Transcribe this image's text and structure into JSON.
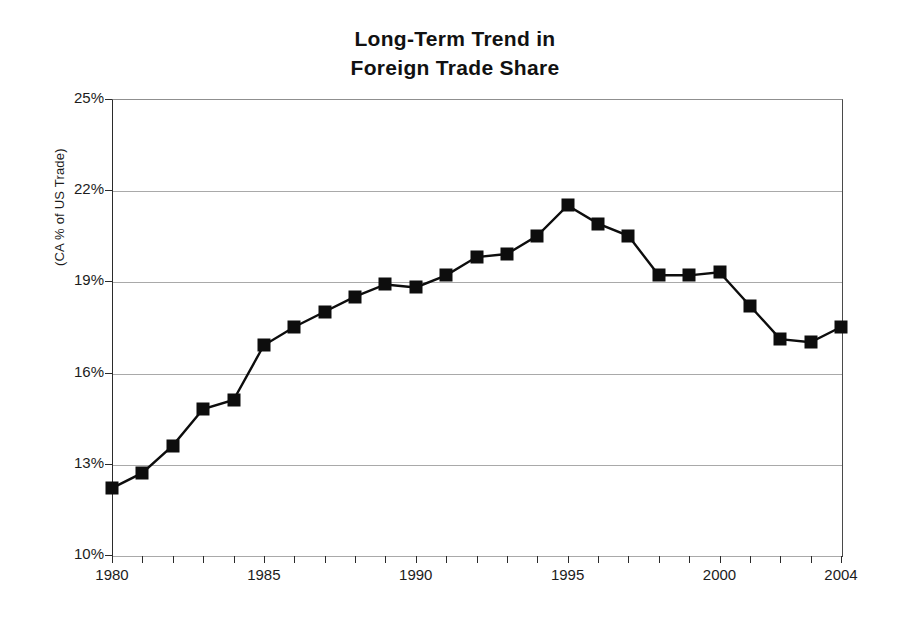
{
  "chart_data": {
    "type": "line",
    "title": "Long-Term Trend in Foreign Trade Share",
    "title_line1": "Long-Term Trend in",
    "title_line2": "Foreign Trade Share",
    "xlabel": "",
    "ylabel": "(CA % of US Trade)",
    "ylim": [
      10,
      25
    ],
    "xlim": [
      1980,
      2004
    ],
    "grid": true,
    "grid_axis": "y",
    "legend": false,
    "marker": "square",
    "marker_color": "#0d0d0d",
    "line_color": "#0d0d0d",
    "y_tick_labels": [
      "25%",
      "22%",
      "19%",
      "16%",
      "13%",
      "10%"
    ],
    "y_tick_values": [
      25,
      22,
      19,
      16,
      13,
      10
    ],
    "x_tick_labels": [
      "1980",
      "1985",
      "1990",
      "1995",
      "2000",
      "2004"
    ],
    "x_tick_values": [
      1980,
      1985,
      1990,
      1995,
      2000,
      2004
    ],
    "x": [
      1980,
      1981,
      1982,
      1983,
      1984,
      1985,
      1986,
      1987,
      1988,
      1989,
      1990,
      1991,
      1992,
      1993,
      1994,
      1995,
      1996,
      1997,
      1998,
      1999,
      2000,
      2001,
      2002,
      2003,
      2004
    ],
    "values": [
      12.2,
      12.7,
      13.6,
      14.8,
      15.1,
      16.9,
      17.5,
      18.0,
      18.5,
      18.9,
      18.8,
      19.2,
      19.8,
      19.9,
      20.5,
      21.5,
      20.9,
      20.5,
      19.2,
      19.2,
      19.3,
      18.2,
      17.1,
      17.0,
      17.5
    ],
    "points": [
      {
        "x": 1980,
        "y": 12.2
      },
      {
        "x": 1981,
        "y": 12.7
      },
      {
        "x": 1982,
        "y": 13.6
      },
      {
        "x": 1983,
        "y": 14.8
      },
      {
        "x": 1984,
        "y": 15.1
      },
      {
        "x": 1985,
        "y": 16.9
      },
      {
        "x": 1986,
        "y": 17.5
      },
      {
        "x": 1987,
        "y": 18.0
      },
      {
        "x": 1988,
        "y": 18.5
      },
      {
        "x": 1989,
        "y": 18.9
      },
      {
        "x": 1990,
        "y": 18.8
      },
      {
        "x": 1991,
        "y": 19.2
      },
      {
        "x": 1992,
        "y": 19.8
      },
      {
        "x": 1993,
        "y": 19.9
      },
      {
        "x": 1994,
        "y": 20.5
      },
      {
        "x": 1995,
        "y": 21.5
      },
      {
        "x": 1996,
        "y": 20.9
      },
      {
        "x": 1997,
        "y": 20.5
      },
      {
        "x": 1998,
        "y": 19.2
      },
      {
        "x": 1999,
        "y": 19.2
      },
      {
        "x": 2000,
        "y": 19.3
      },
      {
        "x": 2001,
        "y": 18.2
      },
      {
        "x": 2002,
        "y": 17.1
      },
      {
        "x": 2003,
        "y": 17.0
      },
      {
        "x": 2004,
        "y": 17.5
      }
    ]
  },
  "colors": {
    "ink": "#0d0d0d",
    "axis": "#2b2b2b",
    "grid": "#a9a9a9",
    "background": "#ffffff"
  }
}
